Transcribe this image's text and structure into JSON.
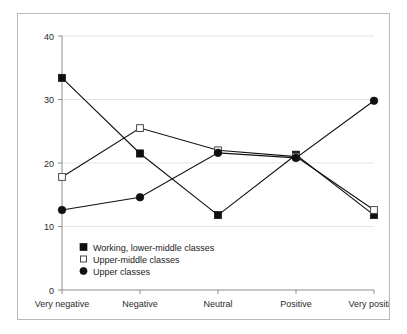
{
  "chart_data": {
    "type": "line",
    "title": "",
    "xlabel": "",
    "ylabel": "",
    "categories": [
      "Very negative",
      "Negative",
      "Neutral",
      "Positive",
      "Very positive"
    ],
    "ylim": [
      0,
      40
    ],
    "yticks": [
      0,
      10,
      20,
      30,
      40
    ],
    "ytick_labels": [
      "0",
      "10",
      "20",
      "30",
      "40"
    ],
    "grid": true,
    "grid_axis": "y",
    "legend_position": "lower-left-inside",
    "series": [
      {
        "name": "Working, lower-middle classes",
        "marker": "filled-square",
        "color": "#101010",
        "values": [
          33.4,
          21.5,
          11.8,
          21.3,
          11.8
        ]
      },
      {
        "name": "Upper-middle classes",
        "marker": "open-square",
        "color": "#4a4a4a",
        "values": [
          17.8,
          25.5,
          22.0,
          21.0,
          12.6
        ]
      },
      {
        "name": "Upper classes",
        "marker": "filled-circle",
        "color": "#101010",
        "values": [
          12.6,
          14.6,
          21.6,
          20.8,
          29.8
        ]
      }
    ]
  },
  "axis": {
    "y_tick_0": "0",
    "y_tick_1": "10",
    "y_tick_2": "20",
    "y_tick_3": "30",
    "y_tick_4": "40",
    "x_tick_0": "Very negative",
    "x_tick_1": "Negative",
    "x_tick_2": "Neutral",
    "x_tick_3": "Positive",
    "x_tick_4": "Very positive"
  },
  "legend": {
    "entry_0": "Working, lower-middle classes",
    "entry_1": "Upper-middle classes",
    "entry_2": "Upper classes"
  },
  "colors": {
    "frame_border": "#b9b9b9",
    "gridline": "#e4e4e4",
    "axis": "#8d8d8d",
    "ink": "#111111",
    "background": "#ffffff"
  }
}
